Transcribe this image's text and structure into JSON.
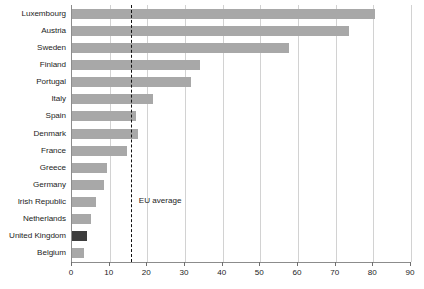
{
  "chart_data": {
    "type": "bar",
    "orientation": "horizontal",
    "title": "",
    "subtitle": "",
    "xlabel": "",
    "ylabel": "",
    "xlim": [
      0,
      90
    ],
    "xticks": [
      0,
      10,
      20,
      30,
      40,
      50,
      60,
      70,
      80,
      90
    ],
    "xtick_labels": [
      "0",
      "10",
      "20",
      "30",
      "40",
      "50",
      "60",
      "70",
      "80",
      "90"
    ],
    "grid": true,
    "legend": null,
    "categories": [
      "Luxembourg",
      "Austria",
      "Sweden",
      "Finland",
      "Portugal",
      "Italy",
      "Spain",
      "Denmark",
      "France",
      "Greece",
      "Germany",
      "Irish Republic",
      "Netherlands",
      "United Kingdom",
      "Belgium"
    ],
    "values": [
      80.5,
      73.5,
      57.5,
      34,
      31.5,
      21.5,
      17,
      17.5,
      14.5,
      9.3,
      8.5,
      6.5,
      5,
      4,
      3.3
    ],
    "highlight_category": "United Kingdom",
    "annotations": [
      {
        "name": "eu-average",
        "label": "EU average",
        "value": 15.6,
        "style": "dashed-vertical-line"
      }
    ],
    "colors": {
      "bar": "#a8a8a8",
      "bar_highlight": "#3c3c3c",
      "gridline": "#d2d2d2",
      "axis": "#8c8c8c",
      "annotation_line": "#111111",
      "text": "#1d1d1d",
      "background": "#ffffff"
    }
  }
}
